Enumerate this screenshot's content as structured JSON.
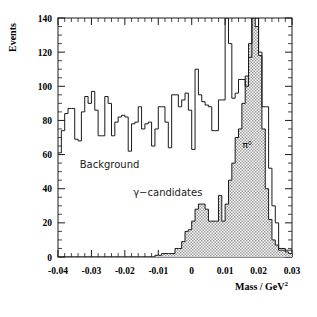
{
  "figure": {
    "background_color": "#ffffff",
    "line_color": "#1a1a1a",
    "fill_color": "#cccccc"
  },
  "axes": {
    "y_title": "Events",
    "x_title_main": "Mass / GeV",
    "x_title_sup": "2",
    "x_ticks": [
      "-0.04",
      "-0.03",
      "-0.02",
      "-0.01",
      "0",
      "0.01",
      "0.02",
      "0.03"
    ],
    "x_tick_values": [
      -0.04,
      -0.03,
      -0.02,
      -0.01,
      0,
      0.01,
      0.02,
      0.03
    ],
    "y_ticks": [
      "0",
      "20",
      "40",
      "60",
      "80",
      "100",
      "120",
      "140"
    ],
    "y_tick_values": [
      0,
      20,
      40,
      60,
      80,
      100,
      120,
      140
    ]
  },
  "annotations": [
    {
      "name": "background-label",
      "text": "Background",
      "x": -0.0335,
      "y": 52
    },
    {
      "name": "gamma-candidates-label",
      "text": "γ−candidates",
      "x": -0.0175,
      "y": 36
    },
    {
      "name": "pi0-label",
      "text": "π⁰",
      "x": 0.0152,
      "y": 64
    }
  ],
  "chart_data": {
    "type": "bar",
    "title": "",
    "subtitle": "",
    "xlabel": "Mass / GeV^2",
    "ylabel": "Events",
    "xlim": [
      -0.04,
      0.03
    ],
    "ylim": [
      0,
      140
    ],
    "grid": false,
    "legend_position": "none",
    "bin_width": 0.001,
    "bin_edges": [
      -0.04,
      -0.039,
      -0.038,
      -0.037,
      -0.036,
      -0.035,
      -0.034,
      -0.033,
      -0.032,
      -0.031,
      -0.03,
      -0.029,
      -0.028,
      -0.027,
      -0.026,
      -0.025,
      -0.024,
      -0.023,
      -0.022,
      -0.021,
      -0.02,
      -0.019,
      -0.018,
      -0.017,
      -0.016,
      -0.015,
      -0.014,
      -0.013,
      -0.012,
      -0.011,
      -0.01,
      -0.009,
      -0.008,
      -0.007,
      -0.006,
      -0.005,
      -0.004,
      -0.003,
      -0.002,
      -0.001,
      0,
      0.001,
      0.002,
      0.003,
      0.004,
      0.005,
      0.006,
      0.007,
      0.008,
      0.009,
      0.01,
      0.011,
      0.012,
      0.013,
      0.014,
      0.015,
      0.016,
      0.017,
      0.018,
      0.019,
      0.02,
      0.021,
      0.022,
      0.023,
      0.024,
      0.025,
      0.026,
      0.027,
      0.028,
      0.029,
      0.03
    ],
    "series": [
      {
        "name": "Background",
        "style": "outline",
        "values": [
          61,
          74,
          84,
          87,
          87,
          69,
          68,
          85,
          94,
          90,
          97,
          86,
          71,
          71,
          94,
          90,
          71,
          79,
          82,
          83,
          82,
          62,
          78,
          79,
          88,
          75,
          78,
          79,
          65,
          75,
          88,
          88,
          79,
          64,
          95,
          95,
          88,
          92,
          96,
          86,
          63,
          110,
          95,
          91,
          89,
          88,
          74,
          74,
          92,
          92,
          140,
          125,
          93,
          96,
          104,
          104,
          100,
          117,
          140,
          140,
          120,
          88,
          88,
          52,
          30,
          20,
          5,
          5,
          4,
          4
        ]
      },
      {
        "name": "γ-candidates",
        "style": "filled",
        "values": [
          0,
          0,
          0,
          0,
          0,
          0,
          0,
          0,
          0,
          0,
          0,
          0,
          0,
          0,
          0,
          0,
          0,
          0,
          0,
          0,
          0,
          0,
          0,
          0,
          0,
          0,
          0,
          0,
          0,
          1,
          1,
          2,
          2,
          2,
          2,
          5,
          5,
          9,
          15,
          16,
          21,
          28,
          31,
          31,
          28,
          21,
          21,
          21,
          36,
          21,
          31,
          45,
          55,
          70,
          75,
          90,
          106,
          125,
          140,
          135,
          118,
          75,
          40,
          22,
          10,
          7,
          4,
          4,
          3,
          2
        ]
      }
    ]
  }
}
